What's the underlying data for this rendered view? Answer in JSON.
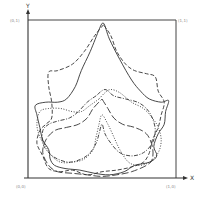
{
  "figure": {
    "x_axis_label": "X",
    "y_axis_label": "Y",
    "corner_labels": {
      "top_left": "(0,1)",
      "top_right": "(1,1)",
      "bottom_left": "(0,0)",
      "bottom_right": "(1,0)"
    },
    "outlines": [
      {
        "name": "leaf-outline-solid",
        "style": "solid",
        "points": [
          [
            0.48,
            0.06
          ],
          [
            0.51,
            0.02
          ],
          [
            0.55,
            0.12
          ],
          [
            0.62,
            0.25
          ],
          [
            0.7,
            0.38
          ],
          [
            0.76,
            0.45
          ],
          [
            0.82,
            0.5
          ],
          [
            0.9,
            0.52
          ],
          [
            0.95,
            0.51
          ],
          [
            0.93,
            0.58
          ],
          [
            0.92,
            0.66
          ],
          [
            0.88,
            0.72
          ],
          [
            0.85,
            0.8
          ],
          [
            0.87,
            0.86
          ],
          [
            0.82,
            0.9
          ],
          [
            0.72,
            0.92
          ],
          [
            0.65,
            0.96
          ],
          [
            0.55,
            0.98
          ],
          [
            0.45,
            0.97
          ],
          [
            0.35,
            0.95
          ],
          [
            0.25,
            0.94
          ],
          [
            0.18,
            0.92
          ],
          [
            0.15,
            0.88
          ],
          [
            0.14,
            0.82
          ],
          [
            0.1,
            0.76
          ],
          [
            0.08,
            0.68
          ],
          [
            0.06,
            0.6
          ],
          [
            0.05,
            0.54
          ],
          [
            0.12,
            0.52
          ],
          [
            0.2,
            0.52
          ],
          [
            0.26,
            0.5
          ],
          [
            0.32,
            0.42
          ],
          [
            0.36,
            0.32
          ],
          [
            0.42,
            0.2
          ],
          [
            0.48,
            0.06
          ]
        ]
      },
      {
        "name": "leaf-outline-dashed",
        "style": "dashed",
        "points": [
          [
            0.51,
            0.03
          ],
          [
            0.45,
            0.1
          ],
          [
            0.38,
            0.2
          ],
          [
            0.3,
            0.28
          ],
          [
            0.2,
            0.32
          ],
          [
            0.14,
            0.33
          ],
          [
            0.14,
            0.42
          ],
          [
            0.16,
            0.52
          ],
          [
            0.16,
            0.62
          ],
          [
            0.12,
            0.66
          ],
          [
            0.08,
            0.7
          ],
          [
            0.06,
            0.78
          ],
          [
            0.1,
            0.86
          ],
          [
            0.14,
            0.94
          ],
          [
            0.22,
            0.96
          ],
          [
            0.3,
            0.95
          ],
          [
            0.4,
            0.98
          ],
          [
            0.5,
            0.96
          ],
          [
            0.6,
            0.95
          ],
          [
            0.7,
            0.93
          ],
          [
            0.78,
            0.9
          ],
          [
            0.82,
            0.84
          ],
          [
            0.84,
            0.76
          ],
          [
            0.88,
            0.68
          ],
          [
            0.9,
            0.6
          ],
          [
            0.92,
            0.52
          ],
          [
            0.88,
            0.45
          ],
          [
            0.86,
            0.36
          ],
          [
            0.8,
            0.34
          ],
          [
            0.72,
            0.32
          ],
          [
            0.66,
            0.28
          ],
          [
            0.6,
            0.2
          ],
          [
            0.56,
            0.1
          ],
          [
            0.51,
            0.03
          ]
        ]
      },
      {
        "name": "leaf-outline-dotted",
        "style": "dotted",
        "points": [
          [
            0.48,
            0.5
          ],
          [
            0.42,
            0.54
          ],
          [
            0.36,
            0.58
          ],
          [
            0.3,
            0.58
          ],
          [
            0.22,
            0.56
          ],
          [
            0.14,
            0.56
          ],
          [
            0.08,
            0.58
          ],
          [
            0.06,
            0.66
          ],
          [
            0.08,
            0.74
          ],
          [
            0.12,
            0.8
          ],
          [
            0.16,
            0.86
          ],
          [
            0.22,
            0.9
          ],
          [
            0.3,
            0.9
          ],
          [
            0.38,
            0.88
          ],
          [
            0.44,
            0.82
          ],
          [
            0.46,
            0.74
          ],
          [
            0.48,
            0.66
          ],
          [
            0.5,
            0.6
          ],
          [
            0.54,
            0.66
          ],
          [
            0.58,
            0.74
          ],
          [
            0.62,
            0.82
          ],
          [
            0.68,
            0.9
          ],
          [
            0.75,
            0.92
          ],
          [
            0.82,
            0.9
          ],
          [
            0.88,
            0.84
          ],
          [
            0.9,
            0.76
          ],
          [
            0.88,
            0.68
          ],
          [
            0.84,
            0.62
          ],
          [
            0.78,
            0.56
          ],
          [
            0.7,
            0.52
          ],
          [
            0.62,
            0.46
          ],
          [
            0.56,
            0.44
          ],
          [
            0.52,
            0.46
          ],
          [
            0.48,
            0.5
          ]
        ]
      },
      {
        "name": "leaf-outline-dash-dot",
        "style": "dash-dot",
        "points": [
          [
            0.46,
            0.48
          ],
          [
            0.4,
            0.52
          ],
          [
            0.34,
            0.58
          ],
          [
            0.28,
            0.62
          ],
          [
            0.2,
            0.64
          ],
          [
            0.14,
            0.66
          ],
          [
            0.1,
            0.7
          ],
          [
            0.1,
            0.78
          ],
          [
            0.14,
            0.84
          ],
          [
            0.2,
            0.88
          ],
          [
            0.28,
            0.9
          ],
          [
            0.36,
            0.88
          ],
          [
            0.42,
            0.84
          ],
          [
            0.46,
            0.78
          ],
          [
            0.48,
            0.72
          ],
          [
            0.5,
            0.66
          ],
          [
            0.52,
            0.72
          ],
          [
            0.56,
            0.78
          ],
          [
            0.62,
            0.84
          ],
          [
            0.7,
            0.86
          ],
          [
            0.78,
            0.84
          ],
          [
            0.84,
            0.78
          ],
          [
            0.86,
            0.7
          ],
          [
            0.84,
            0.62
          ],
          [
            0.8,
            0.56
          ],
          [
            0.74,
            0.52
          ],
          [
            0.66,
            0.5
          ],
          [
            0.58,
            0.48
          ],
          [
            0.52,
            0.44
          ],
          [
            0.46,
            0.48
          ]
        ]
      },
      {
        "name": "leaf-outline-long-dash",
        "style": "long-dash",
        "points": [
          [
            0.5,
            0.5
          ],
          [
            0.54,
            0.56
          ],
          [
            0.58,
            0.62
          ],
          [
            0.64,
            0.66
          ],
          [
            0.72,
            0.68
          ],
          [
            0.8,
            0.72
          ],
          [
            0.84,
            0.8
          ],
          [
            0.84,
            0.88
          ],
          [
            0.8,
            0.92
          ],
          [
            0.7,
            0.96
          ],
          [
            0.6,
            0.98
          ],
          [
            0.5,
            0.99
          ],
          [
            0.4,
            0.98
          ],
          [
            0.3,
            0.97
          ],
          [
            0.2,
            0.96
          ],
          [
            0.14,
            0.92
          ],
          [
            0.1,
            0.84
          ],
          [
            0.12,
            0.76
          ],
          [
            0.18,
            0.7
          ],
          [
            0.26,
            0.68
          ],
          [
            0.34,
            0.66
          ],
          [
            0.4,
            0.62
          ],
          [
            0.44,
            0.56
          ],
          [
            0.5,
            0.5
          ]
        ]
      }
    ]
  }
}
